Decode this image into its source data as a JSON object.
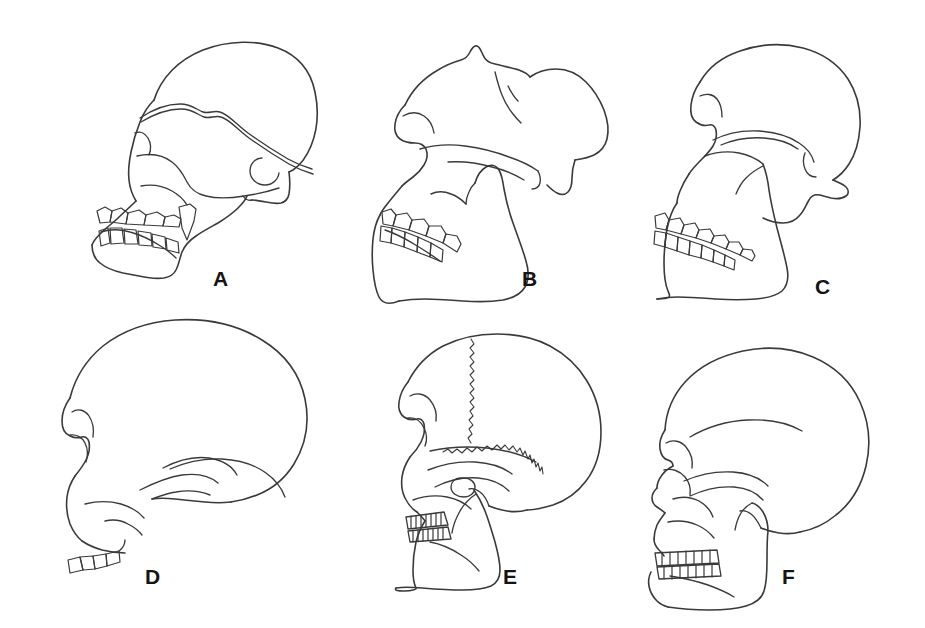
{
  "figure": {
    "caption": "",
    "background_color": "#ffffff",
    "line_color": "#3a3a3c",
    "label_color": "#141414",
    "layout": {
      "columns": 3,
      "rows": 2,
      "width": 925,
      "height": 628
    }
  },
  "panels": [
    {
      "id": "A",
      "label": "A",
      "label_x": 213,
      "label_y": 268,
      "row": 1,
      "column": 1,
      "description": "Ape-like skull in left lateral view with strongly prognathic muzzle, projecting canine, low rounded braincase, prominent temporal line crossing the vault and a circular external auditory meatus",
      "features": [
        "prognathic-muzzle",
        "large-projecting-canine",
        "low-braincase",
        "temporal-line",
        "ear-opening",
        "diastema",
        "heavy-mandible"
      ],
      "has_mandible": true,
      "has_sutures": false,
      "tooth_count_upper": 6,
      "tooth_count_lower": 6
    },
    {
      "id": "B",
      "label": "B",
      "label_x": 522,
      "label_y": 268,
      "row": 1,
      "column": 2,
      "description": "Robust australopithecine-type cranium in left lateral view with sagittal crest, dished face, deep zygomatic arch, very large molars and a massive deep mandible",
      "features": [
        "sagittal-crest",
        "dished-face",
        "flaring-zygomatic-arch",
        "megadont-molars",
        "deep-mandibular-corpus",
        "broad-ramus"
      ],
      "has_mandible": true,
      "has_sutures": false,
      "tooth_count_upper": 5,
      "tooth_count_lower": 5
    },
    {
      "id": "C",
      "label": "C",
      "label_x": 815,
      "label_y": 276,
      "row": 1,
      "column": 3,
      "description": "Robust skull in left lateral view with smooth high vault, strong supraorbital region, wide flaring zygomatic arch, large square molar row and tall mandibular ramus",
      "features": [
        "high-vault",
        "supraorbital-torus",
        "wide-zygomatic-arch",
        "large-molar-row",
        "tall-ramus",
        "receding-chin"
      ],
      "has_mandible": true,
      "has_sutures": false,
      "tooth_count_upper": 7,
      "tooth_count_lower": 7
    },
    {
      "id": "D",
      "label": "D",
      "label_x": 145,
      "label_y": 566,
      "row": 2,
      "column": 1,
      "description": "Large-brained Homo cranium in left lateral view, mandible absent, with expanded globular braincase, reduced supraorbital ridge, slender zygomatic arch and a short upper tooth row",
      "features": [
        "expanded-braincase",
        "vertical-forehead",
        "reduced-brow-ridge",
        "slender-zygomatic-arch",
        "orbital-margin",
        "upper-tooth-row-only"
      ],
      "has_mandible": false,
      "has_sutures": false,
      "tooth_count_upper": 4,
      "tooth_count_lower": 0
    },
    {
      "id": "E",
      "label": "E",
      "label_x": 503,
      "label_y": 566,
      "row": 2,
      "column": 2,
      "description": "Archaic Homo skull in left lateral view showing zigzag coronal and squamosal sutures, pronounced brow ridge, long low vault, mastoid process and a full upper and lower tooth row",
      "features": [
        "coronal-suture",
        "squamosal-suture",
        "brow-ridge",
        "long-low-vault",
        "mastoid-process",
        "full-dentition",
        "receding-chin"
      ],
      "has_mandible": true,
      "has_sutures": true,
      "sutures": [
        "coronal",
        "squamosal"
      ],
      "tooth_count_upper": 8,
      "tooth_count_lower": 8
    },
    {
      "id": "F",
      "label": "F",
      "label_x": 782,
      "label_y": 566,
      "row": 2,
      "column": 3,
      "description": "Modern Homo sapiens skull in left lateral view with globular braincase, vertical forehead, small orthognathic face, nasal aperture, small even teeth and a projecting chin",
      "features": [
        "globular-braincase",
        "vertical-forehead",
        "orthognathic-face",
        "nasal-aperture",
        "small-even-teeth",
        "projecting-chin",
        "mastoid-process"
      ],
      "has_mandible": true,
      "has_sutures": false,
      "tooth_count_upper": 8,
      "tooth_count_lower": 8
    }
  ]
}
